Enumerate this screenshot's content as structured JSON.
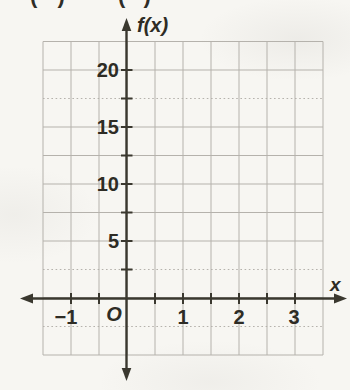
{
  "page": {
    "cropped_top_fragments": [
      "( )",
      "( )"
    ]
  },
  "chart_data": {
    "type": "line",
    "title": "",
    "xlabel": "x",
    "ylabel": "f(x)",
    "origin_label": "O",
    "x_tick_labels": [
      "−1",
      "O",
      "1",
      "2",
      "3"
    ],
    "x_tick_values": [
      -1,
      0,
      1,
      2,
      3
    ],
    "y_tick_labels": [
      "20",
      "15",
      "10",
      "5"
    ],
    "y_tick_values": [
      20,
      15,
      10,
      5
    ],
    "xlim": [
      -1.5,
      3.5
    ],
    "ylim": [
      -5,
      22.5
    ],
    "x_grid_step": 0.5,
    "y_grid_step": 2.5,
    "grid": true,
    "legend": false,
    "series": [],
    "colors": {
      "paper": "#f7f6f2",
      "gridline": "#b5b2ac",
      "axis": "#3a382f",
      "text": "#2e2c25"
    }
  }
}
